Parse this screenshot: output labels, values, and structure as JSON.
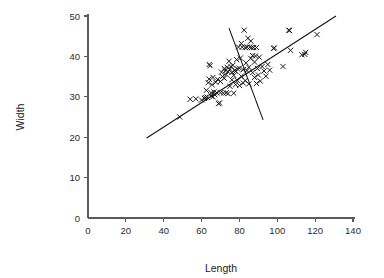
{
  "chart_data": {
    "type": "scatter",
    "title": "",
    "xlabel": "Length",
    "ylabel": "Width",
    "xlim": [
      0,
      140
    ],
    "ylim": [
      0,
      50
    ],
    "xticks": [
      0,
      20,
      40,
      60,
      80,
      100,
      120,
      140
    ],
    "yticks": [
      0,
      10,
      20,
      30,
      40,
      50
    ],
    "xtick_labels": [
      "0",
      "20",
      "40",
      "60",
      "80",
      "100",
      "120",
      "140"
    ],
    "ytick_labels": [
      "0",
      "10",
      "20",
      "30",
      "40",
      "50"
    ],
    "grid": false,
    "legend": null,
    "marker": "x",
    "marker_color": "#111111",
    "axis_color": "#5a5a5a",
    "points": [
      [
        48.5,
        25.0
      ],
      [
        54.0,
        29.4
      ],
      [
        57.0,
        29.5
      ],
      [
        60.0,
        29.2
      ],
      [
        61.5,
        29.6
      ],
      [
        62.0,
        29.8
      ],
      [
        62.5,
        31.6
      ],
      [
        63.0,
        29.9
      ],
      [
        63.5,
        33.5
      ],
      [
        64.0,
        34.4
      ],
      [
        64.0,
        38.0
      ],
      [
        64.5,
        37.7
      ],
      [
        65.0,
        30.2
      ],
      [
        65.0,
        31.0
      ],
      [
        65.5,
        33.0
      ],
      [
        66.0,
        30.0
      ],
      [
        66.0,
        34.8
      ],
      [
        66.5,
        31.2
      ],
      [
        67.0,
        30.5
      ],
      [
        67.5,
        33.6
      ],
      [
        68.0,
        31.0
      ],
      [
        68.5,
        34.3
      ],
      [
        69.0,
        28.3
      ],
      [
        69.5,
        28.5
      ],
      [
        70.0,
        31.0
      ],
      [
        70.0,
        33.8
      ],
      [
        70.5,
        36.1
      ],
      [
        71.0,
        35.0
      ],
      [
        71.5,
        30.9
      ],
      [
        72.0,
        34.6
      ],
      [
        72.0,
        37.0
      ],
      [
        72.5,
        36.4
      ],
      [
        73.0,
        31.0
      ],
      [
        73.0,
        35.5
      ],
      [
        73.5,
        37.3
      ],
      [
        74.0,
        30.8
      ],
      [
        74.0,
        36.2
      ],
      [
        74.5,
        38.8
      ],
      [
        75.0,
        32.6
      ],
      [
        75.0,
        36.8
      ],
      [
        75.5,
        37.5
      ],
      [
        76.0,
        34.2
      ],
      [
        76.0,
        36.0
      ],
      [
        76.5,
        37.8
      ],
      [
        77.0,
        30.9
      ],
      [
        77.0,
        35.3
      ],
      [
        77.5,
        36.6
      ],
      [
        78.0,
        33.0
      ],
      [
        78.0,
        36.3
      ],
      [
        78.5,
        39.2
      ],
      [
        79.0,
        34.0
      ],
      [
        79.0,
        36.9
      ],
      [
        79.5,
        42.3
      ],
      [
        80.0,
        32.8
      ],
      [
        80.0,
        37.1
      ],
      [
        80.5,
        39.6
      ],
      [
        81.0,
        35.1
      ],
      [
        81.0,
        43.2
      ],
      [
        81.5,
        42.3
      ],
      [
        82.0,
        33.4
      ],
      [
        82.0,
        36.7
      ],
      [
        82.5,
        46.5
      ],
      [
        83.0,
        34.0
      ],
      [
        83.0,
        42.2
      ],
      [
        83.5,
        38.4
      ],
      [
        84.0,
        36.5
      ],
      [
        84.0,
        42.3
      ],
      [
        84.5,
        44.5
      ],
      [
        85.0,
        33.2
      ],
      [
        85.0,
        37.3
      ],
      [
        85.5,
        42.3
      ],
      [
        86.0,
        39.5
      ],
      [
        86.0,
        43.8
      ],
      [
        86.5,
        42.2
      ],
      [
        87.0,
        36.0
      ],
      [
        87.0,
        40.2
      ],
      [
        87.5,
        42.2
      ],
      [
        88.0,
        34.8
      ],
      [
        88.0,
        38.6
      ],
      [
        88.5,
        40.1
      ],
      [
        89.0,
        33.3
      ],
      [
        89.0,
        42.2
      ],
      [
        89.5,
        37.0
      ],
      [
        90.0,
        35.4
      ],
      [
        90.5,
        39.8
      ],
      [
        91.0,
        33.9
      ],
      [
        92.0,
        37.5
      ],
      [
        93.0,
        36.4
      ],
      [
        94.0,
        35.1
      ],
      [
        95.0,
        38.0
      ],
      [
        96.0,
        36.6
      ],
      [
        98.0,
        42.0
      ],
      [
        98.5,
        42.1
      ],
      [
        103.0,
        37.5
      ],
      [
        106.0,
        46.5
      ],
      [
        106.5,
        46.4
      ],
      [
        107.0,
        41.5
      ],
      [
        113.0,
        40.4
      ],
      [
        114.5,
        40.5
      ],
      [
        115.0,
        41.0
      ],
      [
        121.0,
        45.4
      ]
    ],
    "fit_lines": [
      {
        "name": "major-axis-line",
        "x1": 31.0,
        "y1": 19.8,
        "x2": 131.0,
        "y2": 50.0
      },
      {
        "name": "minor-axis-line",
        "x1": 74.5,
        "y1": 47.0,
        "x2": 92.5,
        "y2": 24.3
      }
    ]
  }
}
